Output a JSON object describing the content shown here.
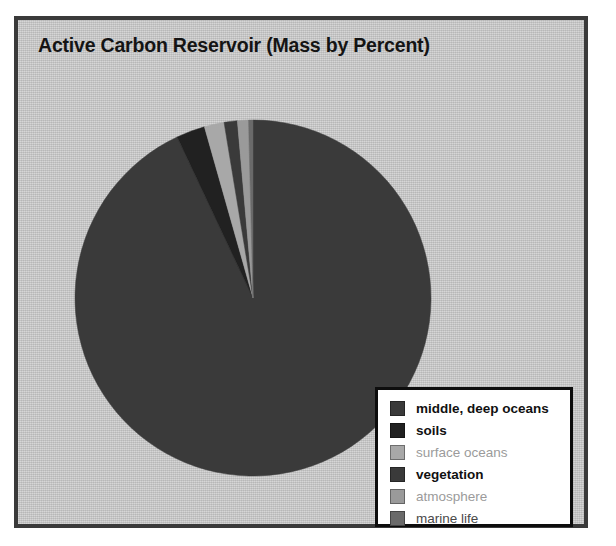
{
  "figure": {
    "title": "Active Carbon Reservoir (Mass by Percent)",
    "frame_color": "#3a3a3a",
    "panel_color": "#c9c9c9"
  },
  "legend": {
    "box_fill": "#ffffff",
    "box_border": "#0d0d0d",
    "items": [
      {
        "label": "middle, deep oceans",
        "color": "#3a3a3a",
        "text_style": "strong"
      },
      {
        "label": "soils",
        "color": "#212121",
        "text_style": "strong"
      },
      {
        "label": "surface oceans",
        "color": "#a8a8a8",
        "text_style": "faint"
      },
      {
        "label": "vegetation",
        "color": "#3a3a3a",
        "text_style": "strong"
      },
      {
        "label": "atmosphere",
        "color": "#9a9a9a",
        "text_style": "faint"
      },
      {
        "label": "marine life",
        "color": "#6a6a6a",
        "text_style": "mid"
      }
    ]
  },
  "chart_data": {
    "type": "pie",
    "title": "Active Carbon Reservoir (Mass by Percent)",
    "xlabel": "",
    "ylabel": "",
    "units": "percent",
    "start_angle_deg": 0,
    "direction": "clockwise",
    "legend_position": "bottom-right",
    "grid": false,
    "center": {
      "x": 239,
      "y": 282
    },
    "radius": 178,
    "categories": [
      "middle, deep oceans",
      "soils",
      "surface oceans",
      "vegetation",
      "atmosphere",
      "marine life"
    ],
    "values": [
      93.0,
      2.6,
      1.8,
      1.2,
      1.0,
      0.4
    ],
    "colors": [
      "#3a3a3a",
      "#212121",
      "#a8a8a8",
      "#3a3a3a",
      "#9a9a9a",
      "#6a6a6a"
    ],
    "slices": [
      {
        "label": "middle, deep oceans",
        "value": 93.0,
        "color": "#3a3a3a"
      },
      {
        "label": "soils",
        "value": 2.6,
        "color": "#212121"
      },
      {
        "label": "surface oceans",
        "value": 1.8,
        "color": "#a8a8a8"
      },
      {
        "label": "vegetation",
        "value": 1.2,
        "color": "#3a3a3a"
      },
      {
        "label": "atmosphere",
        "value": 1.0,
        "color": "#9a9a9a"
      },
      {
        "label": "marine life",
        "value": 0.4,
        "color": "#6a6a6a"
      }
    ]
  }
}
